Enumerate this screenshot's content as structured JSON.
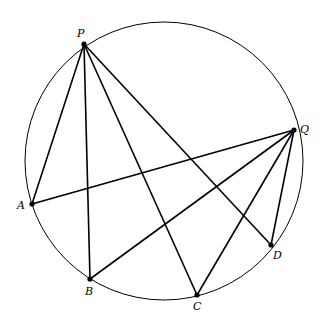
{
  "diagram": {
    "circle": {
      "cx": 164,
      "cy": 161,
      "r": 139
    },
    "points": [
      {
        "name": "P",
        "x": 84,
        "y": 44,
        "lx": 77,
        "ly": 37
      },
      {
        "name": "Q",
        "x": 294,
        "y": 130,
        "lx": 300,
        "ly": 133
      },
      {
        "name": "A",
        "x": 32,
        "y": 204,
        "lx": 17,
        "ly": 209
      },
      {
        "name": "B",
        "x": 90,
        "y": 279,
        "lx": 85,
        "ly": 295
      },
      {
        "name": "C",
        "x": 197,
        "y": 295,
        "lx": 193,
        "ly": 310
      },
      {
        "name": "D",
        "x": 271,
        "y": 245,
        "lx": 273,
        "ly": 259
      }
    ],
    "segments": [
      [
        "P",
        "A"
      ],
      [
        "P",
        "B"
      ],
      [
        "P",
        "C"
      ],
      [
        "P",
        "D"
      ],
      [
        "Q",
        "A"
      ],
      [
        "Q",
        "B"
      ],
      [
        "Q",
        "C"
      ],
      [
        "Q",
        "D"
      ]
    ]
  }
}
